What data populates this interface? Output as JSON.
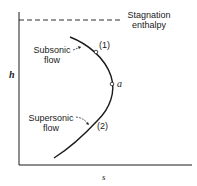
{
  "diagram": {
    "type": "h-s diagram",
    "axes": {
      "y_label": "h",
      "x_label": "s"
    },
    "reference_line": {
      "style": "dashed",
      "label_line1": "Stagnation",
      "label_line2": "enthalpy"
    },
    "curve_labels": {
      "subsonic_line1": "Subsonic",
      "subsonic_line2": "flow",
      "supersonic_line1": "Supersonic",
      "supersonic_line2": "flow"
    },
    "points": {
      "p1": "(1)",
      "pa": "a",
      "p2": "(2)"
    },
    "colors": {
      "ink": "#1a1a1a",
      "background": "#ffffff"
    }
  }
}
